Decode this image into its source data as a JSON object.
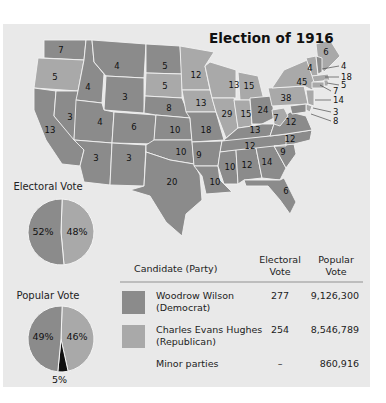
{
  "title": "Election of 1916",
  "colors": {
    "background": "#e9e9e9",
    "democrat": "#8b8b8b",
    "republican": "#a9a9a9",
    "minor": "#111111",
    "border": "#f2f2f2"
  },
  "states": [
    {
      "abbr": "WA",
      "votes": "7",
      "party": "democrat",
      "x": 61,
      "y": 50
    },
    {
      "abbr": "OR",
      "votes": "5",
      "party": "republican",
      "x": 55,
      "y": 77
    },
    {
      "abbr": "CA",
      "votes": "13",
      "party": "democrat",
      "x": 50,
      "y": 130
    },
    {
      "abbr": "NV",
      "votes": "3",
      "party": "democrat",
      "x": 70,
      "y": 117
    },
    {
      "abbr": "ID",
      "votes": "4",
      "party": "democrat",
      "x": 88,
      "y": 87
    },
    {
      "abbr": "MT",
      "votes": "4",
      "party": "democrat",
      "x": 117,
      "y": 66
    },
    {
      "abbr": "WY",
      "votes": "3",
      "party": "democrat",
      "x": 125,
      "y": 97
    },
    {
      "abbr": "UT",
      "votes": "4",
      "party": "democrat",
      "x": 100,
      "y": 122
    },
    {
      "abbr": "CO",
      "votes": "6",
      "party": "democrat",
      "x": 134,
      "y": 127
    },
    {
      "abbr": "AZ",
      "votes": "3",
      "party": "democrat",
      "x": 96,
      "y": 158
    },
    {
      "abbr": "NM",
      "votes": "3",
      "party": "democrat",
      "x": 129,
      "y": 158
    },
    {
      "abbr": "ND",
      "votes": "5",
      "party": "democrat",
      "x": 165,
      "y": 66
    },
    {
      "abbr": "SD",
      "votes": "5",
      "party": "republican",
      "x": 165,
      "y": 86
    },
    {
      "abbr": "NE",
      "votes": "8",
      "party": "democrat",
      "x": 169,
      "y": 108
    },
    {
      "abbr": "KS",
      "votes": "10",
      "party": "democrat",
      "x": 175,
      "y": 130
    },
    {
      "abbr": "OK",
      "votes": "10",
      "party": "democrat",
      "x": 181,
      "y": 152
    },
    {
      "abbr": "TX",
      "votes": "20",
      "party": "democrat",
      "x": 172,
      "y": 182
    },
    {
      "abbr": "MN",
      "votes": "12",
      "party": "republican",
      "x": 196,
      "y": 75
    },
    {
      "abbr": "IA",
      "votes": "13",
      "party": "republican",
      "x": 201,
      "y": 103
    },
    {
      "abbr": "MO",
      "votes": "18",
      "party": "democrat",
      "x": 206,
      "y": 130
    },
    {
      "abbr": "AR",
      "votes": "9",
      "party": "democrat",
      "x": 199,
      "y": 155
    },
    {
      "abbr": "LA",
      "votes": "10",
      "party": "democrat",
      "x": 215,
      "y": 182
    },
    {
      "abbr": "WI",
      "votes": "13",
      "party": "republican",
      "x": 234,
      "y": 85
    },
    {
      "abbr": "IL",
      "votes": "29",
      "party": "republican",
      "x": 227,
      "y": 114
    },
    {
      "abbr": "MI",
      "votes": "15",
      "party": "republican",
      "x": 249,
      "y": 86
    },
    {
      "abbr": "IN",
      "votes": "15",
      "party": "republican",
      "x": 246,
      "y": 114
    },
    {
      "abbr": "OH",
      "votes": "24",
      "party": "democrat",
      "x": 263,
      "y": 110
    },
    {
      "abbr": "KY",
      "votes": "13",
      "party": "democrat",
      "x": 255,
      "y": 130
    },
    {
      "abbr": "TN",
      "votes": "12",
      "party": "democrat",
      "x": 250,
      "y": 146
    },
    {
      "abbr": "MS",
      "votes": "10",
      "party": "democrat",
      "x": 230,
      "y": 167
    },
    {
      "abbr": "AL",
      "votes": "12",
      "party": "democrat",
      "x": 247,
      "y": 165
    },
    {
      "abbr": "GA",
      "votes": "14",
      "party": "democrat",
      "x": 267,
      "y": 162
    },
    {
      "abbr": "FL",
      "votes": "6",
      "party": "democrat",
      "x": 286,
      "y": 191
    },
    {
      "abbr": "SC",
      "votes": "9",
      "party": "democrat",
      "x": 283,
      "y": 152
    },
    {
      "abbr": "NC",
      "votes": "12",
      "party": "democrat",
      "x": 290,
      "y": 139
    },
    {
      "abbr": "VA",
      "votes": "12",
      "party": "democrat",
      "x": 291,
      "y": 122
    },
    {
      "abbr": "WV",
      "votes": "7",
      "party": "republican",
      "x": 276,
      "y": 118
    },
    {
      "abbr": "PA",
      "votes": "38",
      "party": "republican",
      "x": 286,
      "y": 98
    },
    {
      "abbr": "NY",
      "votes": "45",
      "party": "republican",
      "x": 302,
      "y": 82
    },
    {
      "abbr": "VT",
      "votes": "4",
      "party": "republican",
      "x": 310,
      "y": 68
    },
    {
      "abbr": "ME",
      "votes": "6",
      "party": "republican",
      "x": 326,
      "y": 52
    }
  ],
  "callouts": [
    {
      "abbr": "NH",
      "votes": "4",
      "x": 341,
      "y": 66,
      "lx": 322,
      "ly": 69
    },
    {
      "abbr": "MA",
      "votes": "18",
      "x": 341,
      "y": 77,
      "lx": 325,
      "ly": 77
    },
    {
      "abbr": "RI",
      "votes": "5",
      "x": 341,
      "y": 85,
      "lx": 327,
      "ly": 83
    },
    {
      "abbr": "CT",
      "votes": "7",
      "x": 333,
      "y": 91,
      "lx": 320,
      "ly": 85
    },
    {
      "abbr": "NJ",
      "votes": "14",
      "x": 333,
      "y": 100,
      "lx": 315,
      "ly": 100
    },
    {
      "abbr": "DE",
      "votes": "3",
      "x": 333,
      "y": 112,
      "lx": 313,
      "ly": 108
    },
    {
      "abbr": "MD",
      "votes": "8",
      "x": 333,
      "y": 121,
      "lx": 311,
      "ly": 114
    }
  ],
  "pies": {
    "electoral": {
      "title": "Electoral Vote",
      "slices": [
        {
          "label": "52%",
          "value": 52,
          "party": "democrat"
        },
        {
          "label": "48%",
          "value": 48,
          "party": "republican"
        }
      ]
    },
    "popular": {
      "title": "Popular Vote",
      "slices": [
        {
          "label": "49%",
          "value": 49,
          "party": "democrat"
        },
        {
          "label": "46%",
          "value": 46,
          "party": "republican"
        },
        {
          "label": "5%",
          "value": 5,
          "party": "minor"
        }
      ]
    }
  },
  "table": {
    "headers": {
      "candidate": "Candidate (Party)",
      "electoral_line1": "Electoral",
      "electoral_line2": "Vote",
      "popular_line1": "Popular",
      "popular_line2": "Vote"
    },
    "rows": [
      {
        "name": "Woodrow Wilson",
        "party": "(Democrat)",
        "electoral": "277",
        "popular": "9,126,300",
        "swatch": "democrat"
      },
      {
        "name": "Charles Evans Hughes",
        "party": "(Republican)",
        "electoral": "254",
        "popular": "8,546,789",
        "swatch": "republican"
      },
      {
        "name": "Minor parties",
        "party": "",
        "electoral": "–",
        "popular": "860,916",
        "swatch": ""
      }
    ]
  },
  "chart_data": {
    "type": "pie",
    "title": "Election of 1916",
    "charts": [
      {
        "title": "Electoral Vote",
        "labels": [
          "Wilson (Democrat)",
          "Hughes (Republican)"
        ],
        "values": [
          52,
          48
        ]
      },
      {
        "title": "Popular Vote",
        "labels": [
          "Wilson (Democrat)",
          "Hughes (Republican)",
          "Minor parties"
        ],
        "values": [
          49,
          46,
          5
        ]
      }
    ],
    "table": {
      "columns": [
        "Candidate (Party)",
        "Electoral Vote",
        "Popular Vote"
      ],
      "rows": [
        [
          "Woodrow Wilson (Democrat)",
          277,
          9126300
        ],
        [
          "Charles Evans Hughes (Republican)",
          254,
          8546789
        ],
        [
          "Minor parties",
          null,
          860916
        ]
      ]
    }
  }
}
